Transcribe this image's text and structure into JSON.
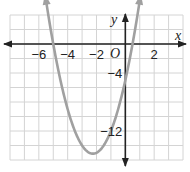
{
  "chart_data": {
    "type": "line",
    "title": "",
    "xlabel": "x",
    "ylabel": "y",
    "origin_label": "O",
    "xlim": [
      -8,
      4
    ],
    "ylim": [
      -16,
      4
    ],
    "grid": true,
    "grid_step_x": 1,
    "grid_step_y": 2,
    "x_ticks": [
      {
        "value": -6,
        "label": "−6"
      },
      {
        "value": -4,
        "label": "−4"
      },
      {
        "value": -2,
        "label": "−2"
      },
      {
        "value": 2,
        "label": "2"
      }
    ],
    "y_ticks": [
      {
        "value": -4,
        "label": "−4"
      },
      {
        "value": -12,
        "label": "−12"
      }
    ],
    "series": [
      {
        "name": "parabola",
        "equation_estimate": "y = 2x^2 + 9x - 5",
        "x_intercepts": [
          -5,
          0.5
        ],
        "y_intercept": -5,
        "vertex": [
          -2.25,
          -15.125
        ],
        "opens": "up",
        "color": "#a0a0a0",
        "arrows_both_ends": true,
        "x": [
          -5.6,
          -5,
          -4,
          -3,
          -2.25,
          -2,
          -1,
          0,
          0.5,
          1.1
        ],
        "values": [
          6.3,
          0,
          -9,
          -14,
          -15.1,
          -15,
          -12,
          -5,
          0,
          7.3
        ]
      }
    ],
    "legend": null
  },
  "colors": {
    "grid": "#d4d4d4",
    "axis": "#222222",
    "curve": "#a0a0a0"
  }
}
